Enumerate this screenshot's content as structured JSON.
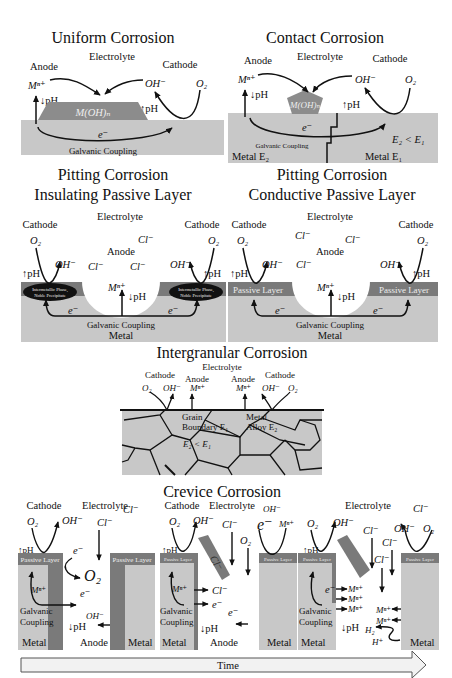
{
  "colors": {
    "metal": "#c8c8c8",
    "passive_layer": "#7a7a7a",
    "precipitate": "#8c8c8c",
    "intermetallic": "#111111",
    "line": "#111111",
    "time_arrow_fill": "#f2f2f2"
  },
  "uniform": {
    "title": "Uniform Corrosion",
    "electrolyte": "Electrolyte",
    "anode": "Anode",
    "cathode": "Cathode",
    "mn": "Mⁿ⁺",
    "oh": "OH⁻",
    "o2": "O₂",
    "ph_down": "↓pH",
    "ph_up": "↑pH",
    "precipitate": "M(OH)ₙ",
    "electron": "e⁻",
    "coupling": "Galvanic Coupling"
  },
  "contact": {
    "title": "Contact Corrosion",
    "electrolyte": "Electrolyte",
    "anode": "Anode",
    "cathode": "Cathode",
    "mn": "Mⁿ⁺",
    "oh": "OH⁻",
    "o2": "O₂",
    "ph_down": "↓pH",
    "ph_up": "↑pH",
    "precipitate": "M(OH)ₙ",
    "electron": "e⁻",
    "potential": "E₂ < E₁",
    "coupling": "Galvanic Coupling",
    "metal_left": "Metal E₂",
    "metal_right": "Metal E₁"
  },
  "pitting_insulating": {
    "title_line1": "Pitting Corrosion",
    "title_line2": "Insulating Passive Layer",
    "electrolyte": "Electrolyte",
    "cathode": "Cathode",
    "anode": "Anode",
    "o2": "O₂",
    "oh": "OH⁻",
    "cl": "Cl⁻",
    "mn": "Mⁿ⁺",
    "ph_up": "↑pH",
    "ph_down": "↓pH",
    "electron": "e⁻",
    "intermetallic_line1": "Intermetallic Phase,",
    "intermetallic_line2": "Noble Precipitate",
    "coupling": "Galvanic Coupling",
    "metal": "Metal"
  },
  "pitting_conductive": {
    "title_line1": "Pitting Corrosion",
    "title_line2": "Conductive Passive Layer",
    "electrolyte": "Electrolyte",
    "cathode": "Cathode",
    "anode": "Anode",
    "o2": "O₂",
    "oh": "OH⁻",
    "cl": "Cl⁻",
    "mn": "Mⁿ⁺",
    "ph_up": "↑pH",
    "ph_down": "↓pH",
    "electron": "e⁻",
    "passive_layer": "Passive Layer",
    "coupling": "Galvanic Coupling",
    "metal": "Metal"
  },
  "intergranular": {
    "title": "Intergranular Corrosion",
    "electrolyte": "Electrolyte",
    "cathode": "Cathode",
    "anode": "Anode",
    "o2": "O₂",
    "oh": "OH⁻",
    "mn": "Mⁿ⁺",
    "grain_boundary_1": "Grain",
    "grain_boundary_2": "Boundary E₁",
    "alloy_1": "Metal",
    "alloy_2": "Alloy E₂",
    "potential": "E₂ < E₁"
  },
  "crevice": {
    "title": "Crevice Corrosion",
    "stage1": {
      "cathode": "Cathode",
      "electrolyte": "Electrolyte",
      "cl_top": "Cl⁻",
      "o2": "O₂",
      "oh": "OH⁻",
      "cl": "Cl⁻",
      "ph_up": "↑pH",
      "passive_layer": "Passive Layer",
      "electron": "e⁻",
      "o2_inside": "O₂",
      "mn": "Mⁿ⁺",
      "galvanic": "Galvanic",
      "coupling": "Coupling",
      "oh_inside": "OH⁻",
      "ph_down": "↓pH",
      "metal_left": "Metal",
      "anode": "Anode",
      "metal_right": "Metal"
    },
    "stage2": {
      "cathode": "Cathode",
      "electrolyte": "Electrolyte",
      "oh_top": "OH⁻",
      "o2": "O₂",
      "oh": "OH⁻",
      "cl": "Cl⁻",
      "o2_right": "O₂",
      "e_right": "e⁻",
      "mn_right": "Mⁿ⁺",
      "ph_up": "↑pH",
      "passive_layer": "Passive Layer",
      "cl_slab": "Cl⁻",
      "mn": "Mⁿ⁺",
      "cl_inside": "Cl⁻",
      "electron": "e⁻",
      "electron2": "e⁻",
      "galvanic": "Galvanic",
      "coupling": "Coupling",
      "ph_down": "↓pH",
      "metal_left": "Metal",
      "anode": "Anode",
      "metal_right": "Metal"
    },
    "stage3": {
      "electrolyte": "Electrolyte",
      "cl_top": "Cl⁻",
      "o2": "O₂",
      "oh": "OH⁻",
      "cl1": "Cl⁻",
      "cl2": "Cl⁻",
      "cl3": "Cl⁻",
      "oh_right": "OH⁻",
      "o2_right": "O₂",
      "ph_up": "↑pH",
      "passive_layer": "Passive Layer",
      "electron": "e⁻",
      "mn1": "Mⁿ⁺",
      "mn2": "Mⁿ⁺",
      "mn3": "Mⁿ⁺",
      "mn4": "Mⁿ⁺",
      "mn5": "Mⁿ⁺",
      "galvanic": "Galvanic",
      "coupling": "Coupling",
      "ph_down": "↓pH",
      "h2": "H₂",
      "h_plus": "H⁺",
      "metal_left": "Metal",
      "metal_right": "Metal"
    }
  },
  "time_arrow": {
    "label": "Time"
  }
}
